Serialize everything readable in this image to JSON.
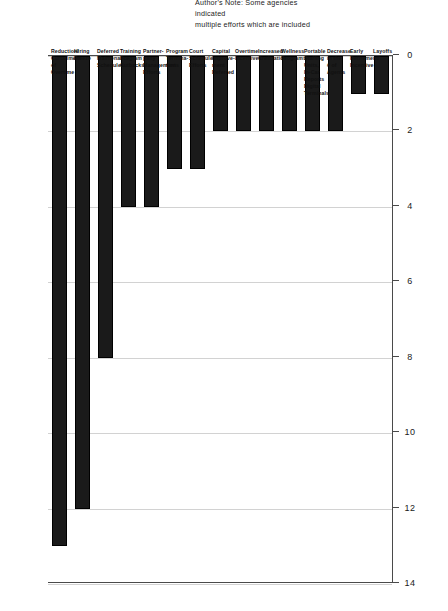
{
  "chart_data": {
    "type": "bar",
    "orientation": "horizontal",
    "title": "",
    "xlabel": "",
    "ylabel": "",
    "xlim": [
      0,
      14
    ],
    "xticks": [
      "0",
      "2",
      "4",
      "6",
      "8",
      "10",
      "12",
      "14"
    ],
    "grid": true,
    "legend": null,
    "bar_color": "#1a1a1a",
    "categories": [
      "Reduction/\nCurtailment\nof Overtime",
      "Hiring\nFreeze",
      "Deferred\nMaintenance\nSchedules",
      "Training\nProgram\nCutbacks",
      "Partner-\npany\nManagement\nEfforts",
      "Program\nTermina-\ntions",
      "Court\nSchedule\nEfforts",
      "Capital\nImprove-\nment\nDeferred",
      "Overtime\nIncentives",
      "Increased\nCivilization",
      "Wellness\nPrograms",
      "Portable\nStaffing\nUnits,\nIn-Car\nReports\nDigital\nTerminals",
      "Decrease\nin the\n# of Agents",
      "Early\nRetirement/\nIncentive",
      "Layoffs"
    ],
    "values": [
      13,
      12,
      8,
      4,
      4,
      3,
      3,
      2,
      2,
      2,
      2,
      2,
      2,
      1,
      1
    ]
  },
  "annotation": {
    "note": "Author's Note: Some agencies indicated\nmultiple efforts which are included"
  },
  "colors": {
    "bar": "#1a1a1a",
    "grid": "#d2d2d2",
    "axis": "#4a4a4a",
    "background": "#ffffff"
  }
}
